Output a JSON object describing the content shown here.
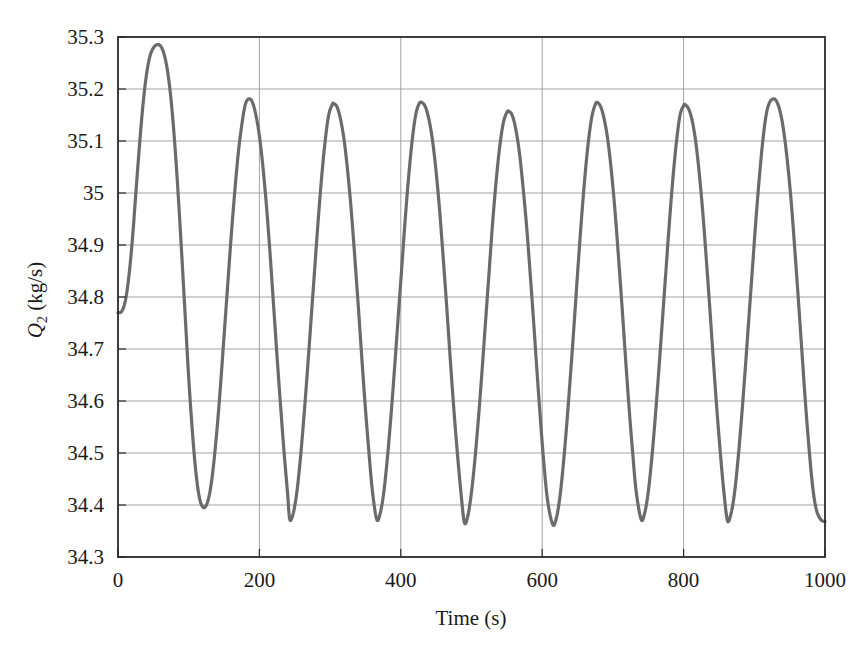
{
  "chart_data": {
    "type": "line",
    "title": "",
    "subtitle": "",
    "xlabel": "Time (s)",
    "ylabel": "Q2 (kg/s)",
    "ylabel_parts": {
      "symbol": "Q",
      "subscript": "2",
      "units": " (kg/s)"
    },
    "xlim": [
      0,
      1000
    ],
    "ylim": [
      34.3,
      35.3
    ],
    "xticks": [
      0,
      200,
      400,
      600,
      800,
      1000
    ],
    "xtick_labels": [
      "0",
      "200",
      "400",
      "600",
      "800",
      "1000"
    ],
    "yticks": [
      34.3,
      34.4,
      34.5,
      34.6,
      34.7,
      34.8,
      34.9,
      35.0,
      35.1,
      35.2,
      35.3
    ],
    "ytick_labels": [
      "34.3",
      "34.4",
      "34.5",
      "34.6",
      "34.7",
      "34.8",
      "34.9",
      "35",
      "35.1",
      "35.2",
      "35.3"
    ],
    "grid": {
      "horizontal": true,
      "vertical": true,
      "color": "#999999"
    },
    "legend": null,
    "legend_position": "none",
    "line_color": "#6b6b6b",
    "line_width": 3.2,
    "frame_color": "#2b2b2b",
    "background": "#ffffff",
    "annotations": [],
    "series": [
      {
        "name": "Q2",
        "color": "#6b6b6b",
        "start_value": 34.77,
        "first_peak": {
          "x": 57,
          "y": 35.285
        },
        "steady_peak_mean": 35.172,
        "steady_trough_mean": 34.372,
        "period": 124,
        "peaks": [
          {
            "x": 57,
            "y": 35.285
          },
          {
            "x": 182,
            "y": 35.181
          },
          {
            "x": 305,
            "y": 35.172
          },
          {
            "x": 430,
            "y": 35.174
          },
          {
            "x": 553,
            "y": 35.157
          },
          {
            "x": 678,
            "y": 35.174
          },
          {
            "x": 802,
            "y": 35.17
          },
          {
            "x": 928,
            "y": 35.181
          }
        ],
        "troughs": [
          {
            "x": 120,
            "y": 34.396
          },
          {
            "x": 243,
            "y": 34.372
          },
          {
            "x": 366,
            "y": 34.372
          },
          {
            "x": 490,
            "y": 34.366
          },
          {
            "x": 615,
            "y": 34.362
          },
          {
            "x": 740,
            "y": 34.372
          },
          {
            "x": 862,
            "y": 34.37
          },
          {
            "x": 1000,
            "y": 34.368
          }
        ],
        "points": [
          [
            0,
            34.77
          ],
          [
            5,
            34.772
          ],
          [
            10,
            34.79
          ],
          [
            15,
            34.835
          ],
          [
            20,
            34.905
          ],
          [
            25,
            34.995
          ],
          [
            30,
            35.085
          ],
          [
            35,
            35.165
          ],
          [
            40,
            35.225
          ],
          [
            45,
            35.262
          ],
          [
            50,
            35.279
          ],
          [
            55,
            35.285
          ],
          [
            60,
            35.283
          ],
          [
            65,
            35.268
          ],
          [
            70,
            35.235
          ],
          [
            75,
            35.18
          ],
          [
            80,
            35.1
          ],
          [
            85,
            35.0
          ],
          [
            90,
            34.885
          ],
          [
            95,
            34.765
          ],
          [
            100,
            34.645
          ],
          [
            105,
            34.545
          ],
          [
            110,
            34.465
          ],
          [
            115,
            34.415
          ],
          [
            120,
            34.396
          ],
          [
            125,
            34.4
          ],
          [
            130,
            34.425
          ],
          [
            135,
            34.475
          ],
          [
            140,
            34.545
          ],
          [
            145,
            34.63
          ],
          [
            150,
            34.725
          ],
          [
            155,
            34.82
          ],
          [
            160,
            34.915
          ],
          [
            165,
            35.0
          ],
          [
            170,
            35.075
          ],
          [
            175,
            35.13
          ],
          [
            180,
            35.17
          ],
          [
            185,
            35.181
          ],
          [
            190,
            35.175
          ],
          [
            195,
            35.15
          ],
          [
            200,
            35.11
          ],
          [
            205,
            35.05
          ],
          [
            210,
            34.975
          ],
          [
            215,
            34.885
          ],
          [
            220,
            34.785
          ],
          [
            225,
            34.685
          ],
          [
            230,
            34.59
          ],
          [
            235,
            34.5
          ],
          [
            240,
            34.42
          ],
          [
            243,
            34.372
          ],
          [
            248,
            34.385
          ],
          [
            253,
            34.425
          ],
          [
            258,
            34.49
          ],
          [
            263,
            34.57
          ],
          [
            268,
            34.66
          ],
          [
            273,
            34.755
          ],
          [
            278,
            34.85
          ],
          [
            283,
            34.945
          ],
          [
            288,
            35.03
          ],
          [
            293,
            35.1
          ],
          [
            298,
            35.15
          ],
          [
            303,
            35.17
          ],
          [
            305,
            35.172
          ],
          [
            310,
            35.165
          ],
          [
            315,
            35.14
          ],
          [
            320,
            35.1
          ],
          [
            325,
            35.04
          ],
          [
            330,
            34.965
          ],
          [
            335,
            34.875
          ],
          [
            340,
            34.78
          ],
          [
            345,
            34.68
          ],
          [
            350,
            34.585
          ],
          [
            355,
            34.5
          ],
          [
            360,
            34.425
          ],
          [
            366,
            34.372
          ],
          [
            371,
            34.385
          ],
          [
            376,
            34.425
          ],
          [
            381,
            34.49
          ],
          [
            386,
            34.57
          ],
          [
            391,
            34.66
          ],
          [
            396,
            34.755
          ],
          [
            401,
            34.85
          ],
          [
            406,
            34.945
          ],
          [
            411,
            35.03
          ],
          [
            416,
            35.1
          ],
          [
            421,
            35.15
          ],
          [
            426,
            35.172
          ],
          [
            430,
            35.174
          ],
          [
            435,
            35.165
          ],
          [
            440,
            35.14
          ],
          [
            445,
            35.1
          ],
          [
            450,
            35.04
          ],
          [
            455,
            34.965
          ],
          [
            460,
            34.875
          ],
          [
            465,
            34.78
          ],
          [
            470,
            34.68
          ],
          [
            475,
            34.585
          ],
          [
            480,
            34.5
          ],
          [
            485,
            34.425
          ],
          [
            490,
            34.366
          ],
          [
            495,
            34.38
          ],
          [
            500,
            34.425
          ],
          [
            505,
            34.49
          ],
          [
            510,
            34.57
          ],
          [
            515,
            34.66
          ],
          [
            520,
            34.755
          ],
          [
            525,
            34.85
          ],
          [
            530,
            34.945
          ],
          [
            535,
            35.025
          ],
          [
            540,
            35.09
          ],
          [
            545,
            35.135
          ],
          [
            550,
            35.155
          ],
          [
            553,
            35.157
          ],
          [
            558,
            35.148
          ],
          [
            563,
            35.12
          ],
          [
            568,
            35.075
          ],
          [
            573,
            35.01
          ],
          [
            578,
            34.935
          ],
          [
            583,
            34.845
          ],
          [
            588,
            34.75
          ],
          [
            593,
            34.65
          ],
          [
            598,
            34.555
          ],
          [
            603,
            34.47
          ],
          [
            608,
            34.405
          ],
          [
            615,
            34.362
          ],
          [
            620,
            34.375
          ],
          [
            625,
            34.415
          ],
          [
            630,
            34.48
          ],
          [
            635,
            34.56
          ],
          [
            640,
            34.65
          ],
          [
            645,
            34.745
          ],
          [
            650,
            34.845
          ],
          [
            655,
            34.94
          ],
          [
            660,
            35.025
          ],
          [
            665,
            35.095
          ],
          [
            670,
            35.145
          ],
          [
            675,
            35.17
          ],
          [
            678,
            35.174
          ],
          [
            683,
            35.165
          ],
          [
            688,
            35.14
          ],
          [
            693,
            35.1
          ],
          [
            698,
            35.04
          ],
          [
            703,
            34.965
          ],
          [
            708,
            34.875
          ],
          [
            713,
            34.78
          ],
          [
            718,
            34.68
          ],
          [
            723,
            34.585
          ],
          [
            728,
            34.5
          ],
          [
            733,
            34.425
          ],
          [
            740,
            34.372
          ],
          [
            745,
            34.385
          ],
          [
            750,
            34.425
          ],
          [
            755,
            34.49
          ],
          [
            760,
            34.57
          ],
          [
            765,
            34.66
          ],
          [
            770,
            34.755
          ],
          [
            775,
            34.85
          ],
          [
            780,
            34.945
          ],
          [
            785,
            35.03
          ],
          [
            790,
            35.1
          ],
          [
            795,
            35.15
          ],
          [
            800,
            35.168
          ],
          [
            802,
            35.17
          ],
          [
            807,
            35.162
          ],
          [
            812,
            35.14
          ],
          [
            817,
            35.1
          ],
          [
            822,
            35.04
          ],
          [
            827,
            34.965
          ],
          [
            832,
            34.875
          ],
          [
            837,
            34.78
          ],
          [
            842,
            34.68
          ],
          [
            847,
            34.585
          ],
          [
            852,
            34.5
          ],
          [
            857,
            34.425
          ],
          [
            862,
            34.37
          ],
          [
            867,
            34.383
          ],
          [
            872,
            34.423
          ],
          [
            877,
            34.488
          ],
          [
            882,
            34.568
          ],
          [
            887,
            34.658
          ],
          [
            892,
            34.753
          ],
          [
            897,
            34.848
          ],
          [
            902,
            34.943
          ],
          [
            907,
            35.028
          ],
          [
            912,
            35.1
          ],
          [
            917,
            35.152
          ],
          [
            922,
            35.175
          ],
          [
            928,
            35.181
          ],
          [
            933,
            35.172
          ],
          [
            938,
            35.148
          ],
          [
            943,
            35.105
          ],
          [
            948,
            35.045
          ],
          [
            953,
            34.97
          ],
          [
            958,
            34.878
          ],
          [
            963,
            34.782
          ],
          [
            968,
            34.682
          ],
          [
            973,
            34.585
          ],
          [
            978,
            34.5
          ],
          [
            983,
            34.43
          ],
          [
            988,
            34.39
          ],
          [
            994,
            34.372
          ],
          [
            1000,
            34.368
          ]
        ]
      }
    ]
  },
  "axes": {
    "plot_left_px": 118,
    "plot_right_px": 825,
    "plot_top_px": 37,
    "plot_bottom_px": 557
  }
}
